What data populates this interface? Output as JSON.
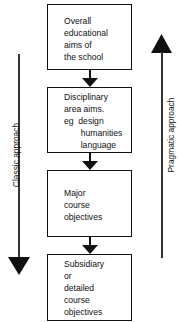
{
  "diagram": {
    "boxes": [
      {
        "lines": "Overall\neducational\naims of\nthe school"
      },
      {
        "lines": "Disciplinary\narea aims.\neg  design\n       humanities\n       language"
      },
      {
        "lines": "Major\ncourse\nobjectives"
      },
      {
        "lines": "Subsidiary\nor\ndetailed\ncourse\nobjectives"
      }
    ],
    "left_arrow": {
      "label": "Classic approach",
      "direction": "down"
    },
    "right_arrow": {
      "label": "Pragmatic approach",
      "direction": "up"
    },
    "colors": {
      "line": "#111111",
      "background": "#ffffff"
    }
  }
}
